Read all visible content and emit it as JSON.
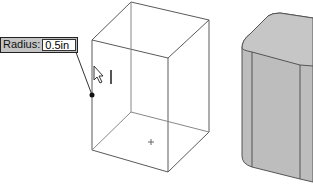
{
  "viewport": {
    "wireframe_box": "box-preview",
    "shaded_solid": "filleted-box-solid"
  },
  "radius_field": {
    "label": "Radius:",
    "value": "0.5in"
  },
  "colors": {
    "edge": "#555555",
    "solid_fill": "#bdbdbd",
    "solid_top": "#c8c8c8",
    "solid_edge": "#555555"
  }
}
